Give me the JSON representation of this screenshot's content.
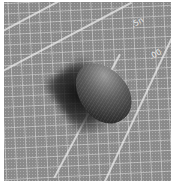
{
  "image": {
    "description": "Grayscale photo of a dark oval object resting on a gridded cutting mat",
    "mat_labels": [
      ".5n",
      ".00"
    ],
    "colors": {
      "mat": "#8a8a8a",
      "grid_lines": "#dcdcdc",
      "object": "#2a2a2a"
    }
  }
}
